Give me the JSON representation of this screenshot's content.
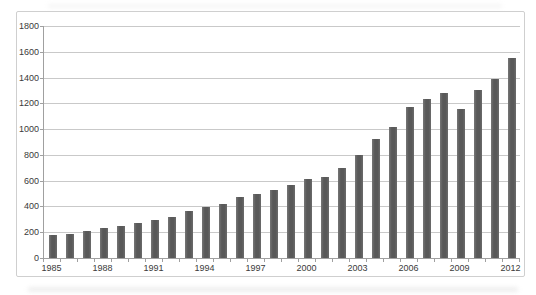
{
  "chart_data": {
    "type": "bar",
    "title": "",
    "xlabel": "",
    "ylabel": "",
    "categories": [
      "1985",
      "1986",
      "1987",
      "1988",
      "1989",
      "1990",
      "1991",
      "1992",
      "1993",
      "1994",
      "1995",
      "1996",
      "1997",
      "1998",
      "1999",
      "2000",
      "2001",
      "2002",
      "2003",
      "2004",
      "2005",
      "2006",
      "2007",
      "2008",
      "2009",
      "2010",
      "2011",
      "2012"
    ],
    "values": [
      175,
      190,
      210,
      230,
      250,
      275,
      295,
      315,
      365,
      395,
      420,
      470,
      500,
      530,
      570,
      615,
      630,
      700,
      800,
      920,
      1015,
      1170,
      1230,
      1280,
      1160,
      1300,
      1390,
      1550
    ],
    "x_tick_labels": [
      "1985",
      "1988",
      "1991",
      "1994",
      "1997",
      "2000",
      "2003",
      "2006",
      "2009",
      "2012"
    ],
    "y_ticks": [
      0,
      200,
      400,
      600,
      800,
      1000,
      1200,
      1400,
      1600,
      1800
    ],
    "ylim": [
      0,
      1800
    ],
    "grid": "horizontal",
    "legend": "none",
    "colors": {
      "bar": "#5d5d5d",
      "gridline": "#c9c9c9",
      "axis": "#a0a0a0",
      "label": "#3a3a3a",
      "frame_border": "#cfcfcf",
      "background": "#ffffff"
    }
  }
}
